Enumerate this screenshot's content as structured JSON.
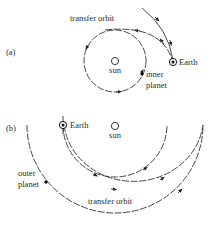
{
  "panel_a": {
    "label": "(a)",
    "title": "transfer orbit",
    "sun_label": "sun",
    "earth_label": "Earth",
    "planet_label_line1": "inner",
    "planet_label_line2": "planet"
  },
  "panel_b": {
    "label": "(b)",
    "title": "transfer orbit",
    "sun_label": "sun",
    "earth_label": "Earth",
    "planet_label_line1": "outer",
    "planet_label_line2": "planet"
  },
  "colors": {
    "ink": "#2a2a2a",
    "background": "#ffffff"
  }
}
